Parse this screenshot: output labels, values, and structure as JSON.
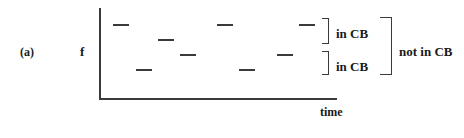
{
  "figure": {
    "panel_label": "(a)",
    "y_axis_label": "f",
    "x_axis_label": "time",
    "brackets": {
      "upper_inner": "in CB",
      "lower_inner": "in CB",
      "outer": "not in CB"
    },
    "segments": [
      {
        "x": 113,
        "y": 24
      },
      {
        "x": 158,
        "y": 39
      },
      {
        "x": 180,
        "y": 54
      },
      {
        "x": 136,
        "y": 69
      },
      {
        "x": 217,
        "y": 24
      },
      {
        "x": 299,
        "y": 24
      },
      {
        "x": 277,
        "y": 54
      },
      {
        "x": 239,
        "y": 69
      }
    ]
  }
}
